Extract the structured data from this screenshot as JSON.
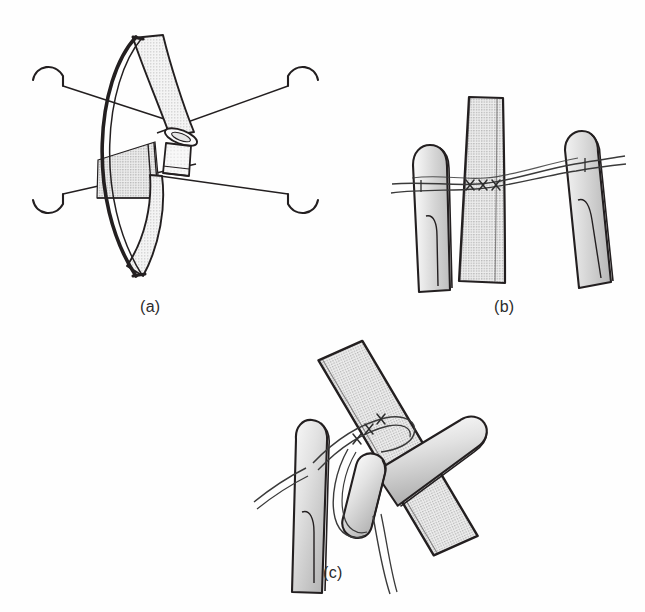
{
  "figure": {
    "background_color": "#fefefe",
    "ink_color": "#231f20",
    "tissue_fill_light": "#e8e8e8",
    "tissue_fill_mid": "#cfcfcf",
    "tissue_fill_dark": "#a8a8a8",
    "suture_color": "#3a3a3a",
    "width": 645,
    "height": 612
  },
  "panels": [
    {
      "id": "a",
      "caption": "(a)",
      "caption_x": 140,
      "caption_y": 298,
      "description": "Cut vessel ends held open by an elliptical retaining frame with four straight traction sutures carrying curved needles at each outer end",
      "elements": {
        "frame_label": "elliptical retractor frame",
        "vessel_upper_label": "proximal vessel stump",
        "vessel_lower_label": "distal vessel stump",
        "needle_count": 4,
        "suture_count": 4,
        "needle_positions": [
          "upper-left",
          "upper-right",
          "lower-left",
          "lower-right"
        ]
      }
    },
    {
      "id": "b",
      "caption": "(b)",
      "caption_x": 494,
      "caption_y": 298,
      "description": "Two forceps tips steady the vessel while a running suture line crosses the vessel wall; three interrupted stitch marks are shown",
      "elements": {
        "forceps_left_label": "left forceps tip",
        "forceps_right_label": "right forceps tip",
        "vessel_label": "vessel segment",
        "stitch_marks": [
          "x",
          "x",
          "x"
        ],
        "stitch_count": 3,
        "suture_strand_count": 2
      }
    },
    {
      "id": "c",
      "caption": "(c)",
      "caption_x": 323,
      "caption_y": 564,
      "description": "Oblique view: suture loop thrown around the vessel and a second instrument, tightening the knot over three placed stitches",
      "elements": {
        "forceps_left_label": "left forceps tip",
        "forceps_right_label": "right forceps tip",
        "vessel_label": "oblique vessel segment",
        "stitch_marks": [
          "x",
          "x",
          "x"
        ],
        "stitch_count": 3,
        "loop_label": "suture loop / knot throw",
        "free_end_count": 2
      }
    }
  ]
}
